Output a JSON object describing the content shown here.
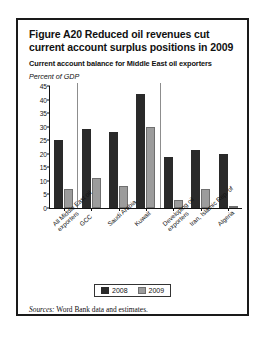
{
  "figure": {
    "title": "Figure A20  Reduced oil revenues cut current account surplus positions in 2009",
    "subtitle": "Current account balance for Middle East oil exporters",
    "axis_label": "Percent of GDP",
    "sources_prefix": "Sources:",
    "sources_text": "Word Bank data and estimates."
  },
  "legend": {
    "items": [
      {
        "label": "2008",
        "color": "#2a2a2a"
      },
      {
        "label": "2009",
        "color": "#9c9c9c"
      }
    ]
  },
  "chart_data": {
    "type": "bar",
    "title": "Current account balance for Middle East oil exporters",
    "xlabel": "",
    "ylabel": "Percent of GDP",
    "ylim": [
      0,
      45
    ],
    "yticks": [
      0,
      5,
      10,
      15,
      20,
      25,
      30,
      35,
      40,
      45
    ],
    "grid": false,
    "legend_position": "bottom",
    "categories": [
      "All Middle East oil exporters",
      "GCC",
      "Saudi Arabia",
      "Kuwait",
      "Developing oil exporters",
      "Iran, Islamic Rep. of",
      "Algeria"
    ],
    "series": [
      {
        "name": "2008",
        "color": "#2a2a2a",
        "values": [
          25,
          29,
          28,
          42,
          19,
          21.5,
          20
        ]
      },
      {
        "name": "2009",
        "color": "#9c9c9c",
        "values": [
          7,
          11,
          8,
          30,
          3,
          7,
          0.5
        ]
      }
    ],
    "separators_after": [
      0,
      3
    ]
  }
}
